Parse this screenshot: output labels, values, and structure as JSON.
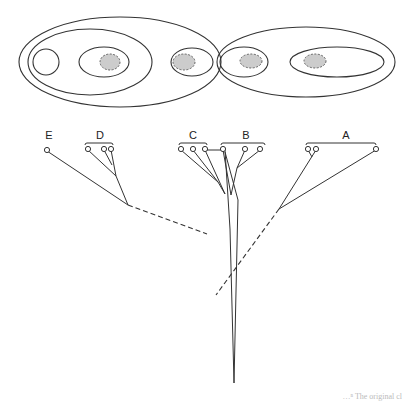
{
  "diagram": {
    "type": "nested-set diagram with cladogram",
    "taxa_labels": {
      "E": "E",
      "D": "D",
      "C": "C",
      "B": "B",
      "A": "A"
    },
    "colors": {
      "line": "#333333",
      "shaded_fill": "#cccccc",
      "background": "#ffffff"
    },
    "caption_fragment": "…ⁿ The original cl"
  }
}
